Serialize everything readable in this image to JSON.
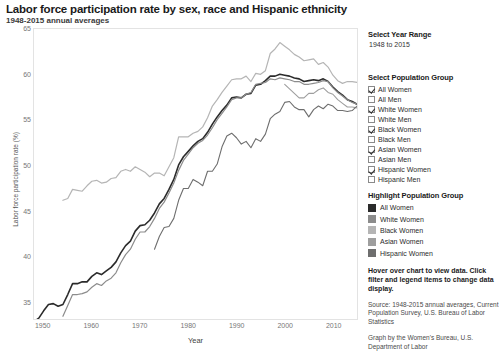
{
  "header": {
    "title": "Labor force participation rate by sex, race and Hispanic ethnicity",
    "subtitle": "1948-2015 annual averages"
  },
  "panel": {
    "year_range": {
      "heading": "Select Year Range",
      "value": "1948 to 2015"
    },
    "population_group": {
      "heading": "Select Population Group",
      "items": [
        {
          "label": "All Women",
          "checked": true
        },
        {
          "label": "All Men",
          "checked": false
        },
        {
          "label": "White Women",
          "checked": true
        },
        {
          "label": "White Men",
          "checked": false
        },
        {
          "label": "Black Women",
          "checked": true
        },
        {
          "label": "Black Men",
          "checked": false
        },
        {
          "label": "Asian Women",
          "checked": true
        },
        {
          "label": "Asian Men",
          "checked": false
        },
        {
          "label": "Hispanic Women",
          "checked": true
        },
        {
          "label": "Hispanic Men",
          "checked": false
        }
      ]
    },
    "highlight": {
      "heading": "Highlight Population Group",
      "items": [
        {
          "label": "All Women",
          "color": "#2b2b2b"
        },
        {
          "label": "White Women",
          "color": "#8c8c8c"
        },
        {
          "label": "Black Women",
          "color": "#b5b5b5"
        },
        {
          "label": "Asian Women",
          "color": "#9e9e9e"
        },
        {
          "label": "Hispanic Women",
          "color": "#6e6e6e"
        }
      ]
    },
    "instructions": "Hover over chart to view data. Click filter and legend items to change data display.",
    "source": "Source: 1948-2015 annual averages, Current Population Survey, U.S. Bureau of Labor Statistics",
    "credit": "Graph by the Women's Bureau, U.S. Department of Labor"
  },
  "chart_data": {
    "type": "line",
    "title": "Labor force participation rate by sex, race and Hispanic ethnicity",
    "subtitle": "1948-2015 annual averages",
    "xlabel": "Year",
    "ylabel": "Labor force participation rate (%)",
    "xlim": [
      1948,
      2015
    ],
    "ylim": [
      33,
      65
    ],
    "yticks": [
      35,
      40,
      45,
      50,
      55,
      60,
      65
    ],
    "xticks": [
      1950,
      1960,
      1970,
      1980,
      1990,
      2000,
      2010
    ],
    "grid": false,
    "legend_position": "right",
    "series": [
      {
        "name": "All Women",
        "color": "#2b2b2b",
        "width": 1.6,
        "x": [
          1948,
          1949,
          1950,
          1951,
          1952,
          1953,
          1954,
          1955,
          1956,
          1957,
          1958,
          1959,
          1960,
          1961,
          1962,
          1963,
          1964,
          1965,
          1966,
          1967,
          1968,
          1969,
          1970,
          1971,
          1972,
          1973,
          1974,
          1975,
          1976,
          1977,
          1978,
          1979,
          1980,
          1981,
          1982,
          1983,
          1984,
          1985,
          1986,
          1987,
          1988,
          1989,
          1990,
          1991,
          1992,
          1993,
          1994,
          1995,
          1996,
          1997,
          1998,
          1999,
          2000,
          2001,
          2002,
          2003,
          2004,
          2005,
          2006,
          2007,
          2008,
          2009,
          2010,
          2011,
          2012,
          2013,
          2014,
          2015
        ],
        "values": [
          32.7,
          33.1,
          33.9,
          34.6,
          34.7,
          34.4,
          34.6,
          35.7,
          36.9,
          36.9,
          37.1,
          37.1,
          37.7,
          38.1,
          37.9,
          38.3,
          38.7,
          39.3,
          40.3,
          41.1,
          41.6,
          42.7,
          43.3,
          43.4,
          43.9,
          44.7,
          45.7,
          46.3,
          47.3,
          48.4,
          50.0,
          50.9,
          51.5,
          52.1,
          52.6,
          52.9,
          53.6,
          54.5,
          55.3,
          56.0,
          56.6,
          57.4,
          57.5,
          57.4,
          57.8,
          57.9,
          58.8,
          58.9,
          59.3,
          59.8,
          59.8,
          60.0,
          59.9,
          59.8,
          59.6,
          59.5,
          59.2,
          59.3,
          59.4,
          59.3,
          59.5,
          59.2,
          58.6,
          58.1,
          57.7,
          57.2,
          57.0,
          56.7
        ]
      },
      {
        "name": "White Women",
        "color": "#8c8c8c",
        "width": 1.2,
        "x": [
          1954,
          1955,
          1956,
          1957,
          1958,
          1959,
          1960,
          1961,
          1962,
          1963,
          1964,
          1965,
          1966,
          1967,
          1968,
          1969,
          1970,
          1971,
          1972,
          1973,
          1974,
          1975,
          1976,
          1977,
          1978,
          1979,
          1980,
          1981,
          1982,
          1983,
          1984,
          1985,
          1986,
          1987,
          1988,
          1989,
          1990,
          1991,
          1992,
          1993,
          1994,
          1995,
          1996,
          1997,
          1998,
          1999,
          2000,
          2001,
          2002,
          2003,
          2004,
          2005,
          2006,
          2007,
          2008,
          2009,
          2010,
          2011,
          2012,
          2013,
          2014,
          2015
        ],
        "values": [
          33.3,
          34.5,
          35.7,
          35.7,
          35.8,
          36.0,
          36.5,
          36.9,
          36.7,
          37.2,
          37.5,
          38.1,
          39.2,
          40.1,
          40.7,
          41.8,
          42.6,
          42.6,
          43.2,
          44.1,
          45.2,
          45.9,
          46.9,
          48.0,
          49.4,
          50.5,
          51.2,
          51.9,
          52.4,
          52.7,
          53.3,
          54.1,
          55.0,
          55.7,
          56.4,
          57.2,
          57.4,
          57.4,
          57.8,
          58.0,
          58.9,
          59.0,
          59.1,
          59.5,
          59.4,
          59.6,
          59.5,
          59.4,
          59.2,
          59.2,
          58.9,
          58.9,
          59.0,
          59.1,
          59.3,
          59.2,
          58.5,
          58.0,
          57.6,
          57.2,
          56.9,
          56.7
        ]
      },
      {
        "name": "Black Women",
        "color": "#b5b5b5",
        "width": 1.2,
        "x": [
          1954,
          1955,
          1956,
          1957,
          1958,
          1959,
          1960,
          1961,
          1962,
          1963,
          1964,
          1965,
          1966,
          1967,
          1968,
          1969,
          1970,
          1971,
          1972,
          1973,
          1974,
          1975,
          1976,
          1977,
          1978,
          1979,
          1980,
          1981,
          1982,
          1983,
          1984,
          1985,
          1986,
          1987,
          1988,
          1989,
          1990,
          1991,
          1992,
          1993,
          1994,
          1995,
          1996,
          1997,
          1998,
          1999,
          2000,
          2001,
          2002,
          2003,
          2004,
          2005,
          2006,
          2007,
          2008,
          2009,
          2010,
          2011,
          2012,
          2013,
          2014,
          2015
        ],
        "values": [
          46.1,
          46.3,
          47.3,
          47.2,
          47.1,
          47.7,
          48.2,
          48.3,
          48.0,
          48.1,
          48.5,
          48.6,
          49.3,
          49.5,
          49.3,
          49.8,
          49.5,
          49.2,
          48.7,
          49.1,
          49.1,
          48.8,
          49.8,
          50.8,
          53.1,
          53.1,
          53.1,
          53.5,
          53.7,
          54.2,
          55.2,
          56.5,
          57.2,
          58.0,
          58.7,
          59.4,
          59.5,
          59.5,
          59.8,
          59.2,
          60.1,
          60.0,
          60.4,
          62.3,
          62.8,
          63.5,
          63.1,
          62.7,
          62.2,
          61.9,
          61.5,
          61.6,
          61.7,
          61.1,
          61.3,
          60.8,
          59.9,
          59.3,
          59.0,
          59.2,
          59.2,
          59.1
        ]
      },
      {
        "name": "Asian Women",
        "color": "#9e9e9e",
        "width": 1.1,
        "x": [
          2000,
          2001,
          2002,
          2003,
          2004,
          2005,
          2006,
          2007,
          2008,
          2009,
          2010,
          2011,
          2012,
          2013,
          2014,
          2015
        ],
        "values": [
          58.9,
          58.4,
          57.9,
          57.4,
          57.4,
          57.9,
          57.9,
          58.3,
          58.5,
          58.0,
          57.8,
          57.2,
          56.8,
          56.4,
          56.4,
          56.3
        ]
      },
      {
        "name": "Hispanic Women",
        "color": "#6e6e6e",
        "width": 1.1,
        "x": [
          1973,
          1974,
          1975,
          1976,
          1977,
          1978,
          1979,
          1980,
          1981,
          1982,
          1983,
          1984,
          1985,
          1986,
          1987,
          1988,
          1989,
          1990,
          1991,
          1992,
          1993,
          1994,
          1995,
          1996,
          1997,
          1998,
          1999,
          2000,
          2001,
          2002,
          2003,
          2004,
          2005,
          2006,
          2007,
          2008,
          2009,
          2010,
          2011,
          2012,
          2013,
          2014,
          2015
        ],
        "values": [
          40.7,
          42.1,
          43.1,
          43.2,
          44.1,
          46.1,
          47.4,
          47.4,
          48.4,
          48.1,
          47.7,
          49.3,
          49.3,
          50.1,
          52.0,
          53.2,
          53.5,
          53.0,
          52.3,
          52.6,
          51.9,
          52.9,
          52.6,
          53.4,
          55.1,
          55.6,
          55.9,
          56.9,
          57.0,
          56.4,
          56.1,
          56.1,
          55.3,
          56.1,
          56.5,
          56.2,
          56.7,
          56.5,
          56.0,
          56.0,
          55.9,
          56.0,
          56.5
        ]
      }
    ]
  }
}
